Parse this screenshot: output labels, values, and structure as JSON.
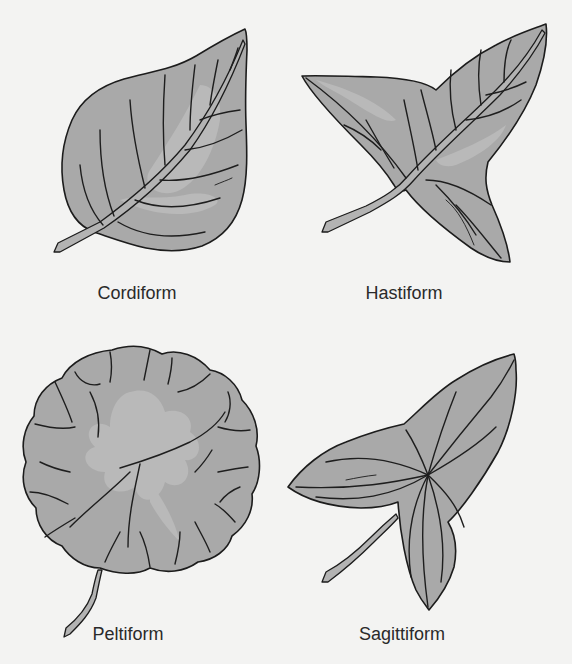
{
  "figure": {
    "colors": {
      "background": "#f3f3f2",
      "leaf_fill": "#a9a9a9",
      "leaf_highlight": "#b9b9b9",
      "outline": "#1c1c1c",
      "label_text": "#2a2a2a"
    },
    "panels": [
      {
        "id": "cordiform",
        "label": "Cordiform",
        "position": "top-left"
      },
      {
        "id": "hastiform",
        "label": "Hastiform",
        "position": "top-right"
      },
      {
        "id": "peltiform",
        "label": "Peltiform",
        "position": "bottom-left"
      },
      {
        "id": "sagittiform",
        "label": "Sagittiform",
        "position": "bottom-right"
      }
    ]
  }
}
